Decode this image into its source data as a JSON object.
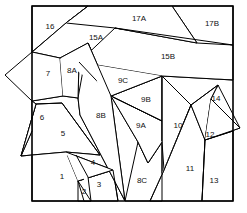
{
  "diagram": {
    "type": "region-map",
    "width": 247,
    "height": 213,
    "background_color": "#ffffff",
    "stroke_color": "#000000",
    "fill_color": "#ffffff",
    "label_color": "#111111",
    "frame": {
      "name": "outer-frame",
      "points": "32,6 233,6 233,201 32,201",
      "stroke_width": 1.6
    },
    "regions": [
      {
        "id": "1",
        "label": "1",
        "label_x": 62,
        "label_y": 177,
        "points": "32,131 76,155 88,177 91,201 32,201"
      },
      {
        "id": "2",
        "label": "2",
        "label_x": 84,
        "label_y": 192,
        "points": "78,181 91,201 78,201"
      },
      {
        "id": "3",
        "label": "3",
        "label_x": 99,
        "label_y": 185,
        "points": "78,181 113,170 118,201 84,201"
      },
      {
        "id": "4",
        "label": "4",
        "label_x": 93,
        "label_y": 163,
        "points": "66,152 113,170 78,181"
      },
      {
        "id": "5",
        "label": "5",
        "label_x": 63,
        "label_y": 134,
        "points": "36,104 62,103 100,155 66,152 21,156"
      },
      {
        "id": "6",
        "label": "6",
        "label_x": 42,
        "label_y": 118,
        "points": "32,101 36,104 21,156 32,131"
      },
      {
        "id": "7",
        "label": "7",
        "label_x": 48,
        "label_y": 74,
        "points": "32,52 60,58 63,96 32,101 5,75"
      },
      {
        "id": "8A",
        "label": "8A",
        "label_x": 72,
        "label_y": 71,
        "points": "62,58 79,62 78,98 63,96"
      },
      {
        "id": "8B",
        "label": "8B",
        "label_x": 101,
        "label_y": 116,
        "points": "88,43 111,96 125,201 80,115 78,98"
      },
      {
        "id": "8C",
        "label": "8C",
        "label_x": 142,
        "label_y": 181,
        "points": "138,142 148,163 162,142 162,201 125,201"
      },
      {
        "id": "9A",
        "label": "9A",
        "label_x": 141,
        "label_y": 126,
        "points": "111,96 162,121 162,142 148,163 138,142"
      },
      {
        "id": "9B",
        "label": "9B",
        "label_x": 146,
        "label_y": 100,
        "points": "111,96 162,76 162,121"
      },
      {
        "id": "9C",
        "label": "9C",
        "label_x": 123,
        "label_y": 81,
        "points": "79,62 162,76 111,96"
      },
      {
        "id": "10",
        "label": "10",
        "label_x": 178,
        "label_y": 126,
        "points": "162,76 191,105 164,170 162,142 162,76"
      },
      {
        "id": "11",
        "label": "11",
        "label_x": 190,
        "label_y": 169,
        "points": "191,105 205,140 202,201 150,201 164,170"
      },
      {
        "id": "12",
        "label": "12",
        "label_x": 210,
        "label_y": 135,
        "points": "211,99 218,85 240,128 205,140"
      },
      {
        "id": "13",
        "label": "13",
        "label_x": 214,
        "label_y": 181,
        "points": "205,140 233,131 233,201 202,201"
      },
      {
        "id": "14",
        "label": "14",
        "label_x": 216,
        "label_y": 99,
        "points": "191,105 218,85 211,99 205,140"
      },
      {
        "id": "15A",
        "label": "15A",
        "label_x": 96,
        "label_y": 38,
        "points": "60,58 88,43 111,96 79,62"
      },
      {
        "id": "15B",
        "label": "15B",
        "label_x": 168,
        "label_y": 57,
        "points": "115,28 233,45 233,80 162,76 79,62"
      },
      {
        "id": "16",
        "label": "16",
        "label_x": 50,
        "label_y": 27,
        "points": "32,6 88,6 66,23 32,52"
      },
      {
        "id": "17A",
        "label": "17A",
        "label_x": 139,
        "label_y": 19,
        "points": "88,6 172,6 197,43 115,28 66,23"
      },
      {
        "id": "17B",
        "label": "17B",
        "label_x": 212,
        "label_y": 24,
        "points": "172,6 233,6 233,45 197,43"
      }
    ],
    "internal_edges": [
      {
        "name": "edge-16-17a",
        "points": "88,6 66,23 32,52"
      },
      {
        "name": "edge-17a-15b",
        "points": "172,6 197,43 115,28"
      },
      {
        "name": "edge-15b-top",
        "points": "115,28 233,45"
      },
      {
        "name": "edge-15b-bottom",
        "points": "79,62 162,76 233,80"
      },
      {
        "name": "edge-7-right",
        "points": "32,52 60,58 63,96 32,101"
      },
      {
        "name": "edge-8a",
        "points": "60,58 79,62 78,98 63,96"
      },
      {
        "name": "edge-15a-spike",
        "points": "60,58 88,43 111,96"
      },
      {
        "name": "edge-9c-9b",
        "points": "79,62 111,96 162,76"
      },
      {
        "name": "edge-9b-9a",
        "points": "111,96 162,121"
      },
      {
        "name": "edge-8b-long",
        "points": "88,43 111,96 125,201"
      },
      {
        "name": "edge-8b-left",
        "points": "78,98 80,115 125,201"
      },
      {
        "name": "edge-10-vertical",
        "points": "162,76 162,201"
      },
      {
        "name": "edge-8c-zigzag",
        "points": "111,96 138,142 148,163 162,142"
      },
      {
        "name": "edge-10-11",
        "points": "191,105 164,170 150,201"
      },
      {
        "name": "edge-14-12",
        "points": "218,85 211,99 205,140"
      },
      {
        "name": "edge-14-left",
        "points": "191,105 218,85"
      },
      {
        "name": "edge-12-flap",
        "points": "211,99 240,128 205,140"
      },
      {
        "name": "edge-13-top",
        "points": "205,140 233,131"
      },
      {
        "name": "edge-13-11",
        "points": "205,140 202,201"
      },
      {
        "name": "edge-5-6",
        "points": "32,101 36,104 21,156 32,131"
      },
      {
        "name": "edge-5-top",
        "points": "36,104 62,103"
      },
      {
        "name": "edge-5-right",
        "points": "62,103 100,155"
      },
      {
        "name": "edge-5-bottom",
        "points": "21,156 66,152 100,155"
      },
      {
        "name": "edge-4",
        "points": "66,152 113,170 78,181"
      },
      {
        "name": "edge-2-3",
        "points": "78,181 91,201"
      },
      {
        "name": "edge-3-right",
        "points": "113,170 118,201"
      },
      {
        "name": "edge-1-right",
        "points": "76,155 88,177 91,201"
      }
    ]
  }
}
